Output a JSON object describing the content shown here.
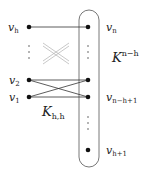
{
  "diagram": {
    "left_nodes": [
      {
        "id": "vh",
        "label": "v",
        "sub": "h",
        "x": 29,
        "y": 27
      },
      {
        "id": "v2",
        "label": "v",
        "sub": "2",
        "x": 29,
        "y": 80
      },
      {
        "id": "v1",
        "label": "v",
        "sub": "1",
        "x": 29,
        "y": 97
      }
    ],
    "right_nodes": [
      {
        "id": "vn",
        "label": "v",
        "sub": "n",
        "x": 88,
        "y": 27
      },
      {
        "id": "vmid",
        "label": "",
        "sub": "",
        "x": 88,
        "y": 80
      },
      {
        "id": "vnh1",
        "label": "v",
        "sub": "n−h+1",
        "x": 88,
        "y": 97
      },
      {
        "id": "vh1",
        "label": "v",
        "sub": "h+1",
        "x": 88,
        "y": 150
      }
    ],
    "edges": [
      [
        "vh",
        "vn"
      ],
      [
        "v2",
        "vmid"
      ],
      [
        "v2",
        "vnh1"
      ],
      [
        "v1",
        "vmid"
      ],
      [
        "v1",
        "vnh1"
      ]
    ],
    "clique_label": {
      "base": "K",
      "sup": "n−h"
    },
    "biclique_label": {
      "base": "K",
      "sub": "h,h"
    },
    "ellipsis": "⋮",
    "colors": {
      "node": "#111111",
      "edge": "#333333",
      "cross": "#b0b0b0",
      "outline": "#555555"
    }
  }
}
